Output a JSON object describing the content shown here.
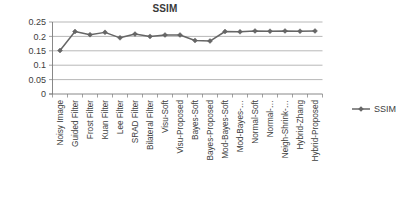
{
  "chart_data": {
    "type": "line",
    "title": "SSIM",
    "xlabel": "",
    "ylabel": "",
    "ylim": [
      0,
      0.25
    ],
    "ytick_values": [
      0,
      0.05,
      0.1,
      0.15,
      0.2,
      0.25
    ],
    "ytick_labels": [
      "0",
      "0.05",
      "0.1",
      "0.15",
      "0.2",
      "0.25"
    ],
    "grid": true,
    "legend_position": "right",
    "legend": [
      "SSIM"
    ],
    "marker": "diamond",
    "series_color": "#666666",
    "categories": [
      "Noisy Image",
      "Guided Filter",
      "Frost Filter",
      "Kuan Filter",
      "Lee Filter",
      "SRAD Filter",
      "Bilateral Filter",
      "Visu-Soft",
      "Visu-Proposed",
      "Bayes-Soft",
      "Bayes-Proposed",
      "Mod-Bayes-Soft",
      "Mod-Bayes-…",
      "Normal-Soft",
      "Normal-…",
      "Neigh-Shrink-…",
      "Hybrid-Zhang",
      "Hybrid-Proposed"
    ],
    "series": [
      {
        "name": "SSIM",
        "values": [
          0.151,
          0.217,
          0.206,
          0.214,
          0.195,
          0.208,
          0.2,
          0.205,
          0.205,
          0.186,
          0.184,
          0.217,
          0.216,
          0.219,
          0.218,
          0.219,
          0.218,
          0.219
        ]
      }
    ]
  }
}
